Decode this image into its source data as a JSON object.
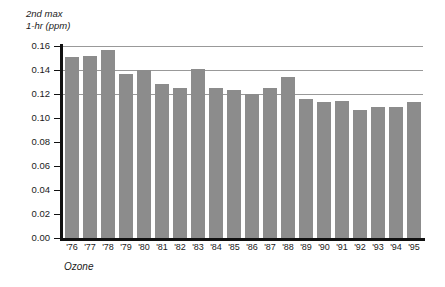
{
  "chart_data": {
    "type": "bar",
    "title": "",
    "subtitle": "",
    "xlabel": "Ozone",
    "ylabel_line1": "2nd max",
    "ylabel_line2": "1-hr (ppm)",
    "categories": [
      "'76",
      "'77",
      "'78",
      "'79",
      "'80",
      "'81",
      "'82",
      "'83",
      "'84",
      "'85",
      "'86",
      "'87",
      "'88",
      "'89",
      "'90",
      "'91",
      "'92",
      "'93",
      "'94",
      "'95"
    ],
    "values": [
      0.151,
      0.152,
      0.157,
      0.137,
      0.14,
      0.128,
      0.125,
      0.141,
      0.125,
      0.123,
      0.12,
      0.125,
      0.134,
      0.116,
      0.113,
      0.114,
      0.107,
      0.109,
      0.109,
      0.113
    ],
    "series": [
      {
        "name": "Ozone 2nd max 1-hr (ppm)",
        "values": [
          0.151,
          0.152,
          0.157,
          0.137,
          0.14,
          0.128,
          0.125,
          0.141,
          0.125,
          0.123,
          0.12,
          0.125,
          0.134,
          0.116,
          0.113,
          0.114,
          0.107,
          0.109,
          0.109,
          0.113
        ]
      }
    ],
    "ylim": [
      0.0,
      0.16
    ],
    "ytick_values": [
      0.0,
      0.02,
      0.04,
      0.06,
      0.08,
      0.1,
      0.12,
      0.14,
      0.16
    ],
    "ytick_labels": [
      "0.00",
      "0.02",
      "0.04",
      "0.06",
      "0.08",
      "0.10",
      "0.12",
      "0.14",
      "0.16"
    ],
    "gridlines_at": [
      0.12,
      0.14,
      0.16
    ],
    "grid": true,
    "legend": "none",
    "bar_color": "#8c8c8c",
    "axis_color": "#111111",
    "gridline_color": "#999999",
    "background_color": "#ffffff"
  }
}
